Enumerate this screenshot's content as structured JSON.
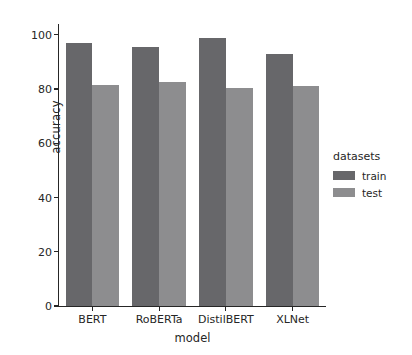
{
  "chart_data": {
    "type": "bar",
    "title": "",
    "xlabel": "model",
    "ylabel": "accuracy",
    "categories": [
      "BERT",
      "RoBERTa",
      "DistilBERT",
      "XLNet"
    ],
    "series": [
      {
        "name": "train",
        "values": [
          97,
          95.5,
          99,
          93
        ],
        "color": "#67676a"
      },
      {
        "name": "test",
        "values": [
          81.5,
          82.5,
          80.5,
          81
        ],
        "color": "#8d8d8f"
      }
    ],
    "ylim": [
      0,
      104
    ],
    "yticks": [
      0,
      20,
      40,
      60,
      80,
      100
    ],
    "ytick_labels": [
      "0",
      "20",
      "40",
      "60",
      "80",
      "100"
    ],
    "grid": false,
    "legend": {
      "title": "datasets",
      "position": "right-outside",
      "entries": [
        "train",
        "test"
      ]
    }
  }
}
